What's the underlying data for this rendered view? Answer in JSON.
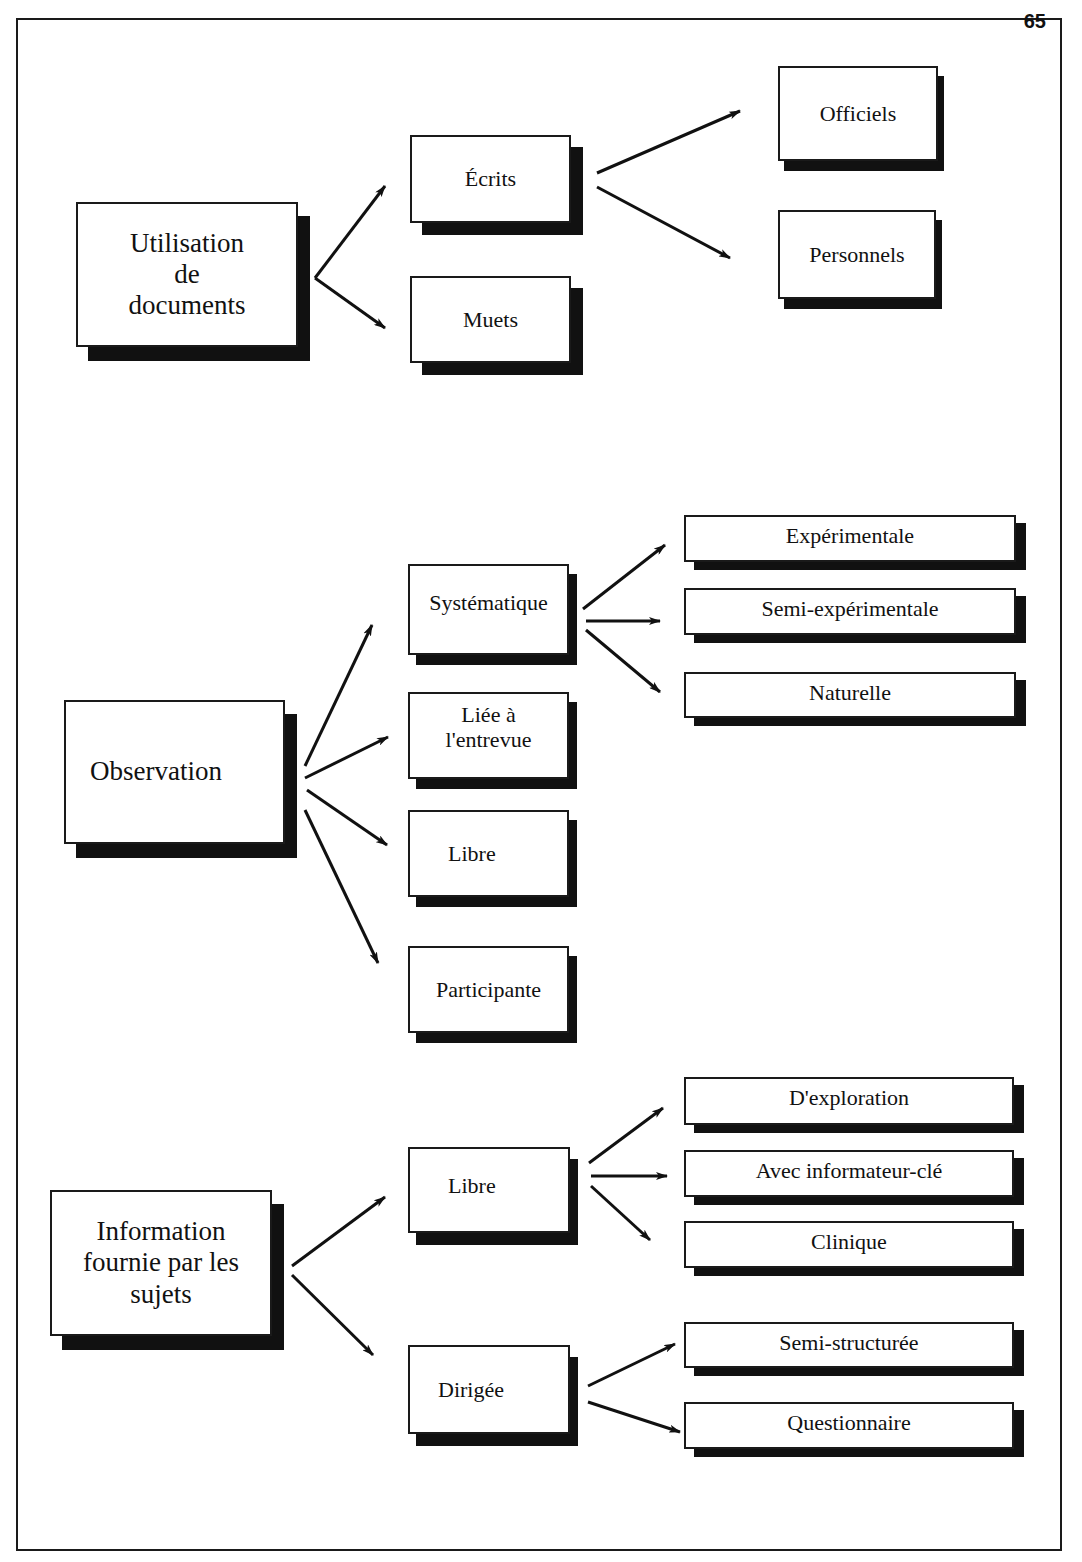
{
  "page": {
    "number": "65"
  },
  "diagram": {
    "groups": [
      {
        "root": "Utilisation\nde\ndocuments",
        "children": [
          {
            "label": "Écrits",
            "children": [
              "Officiels",
              "Personnels"
            ]
          },
          {
            "label": "Muets",
            "children": []
          }
        ]
      },
      {
        "root": "Observation",
        "children": [
          {
            "label": "Systématique",
            "children": [
              "Expérimentale",
              "Semi-expérimentale",
              "Naturelle"
            ]
          },
          {
            "label": "Liée à\nl'entrevue",
            "children": []
          },
          {
            "label": "Libre",
            "children": []
          },
          {
            "label": "Participante",
            "children": []
          }
        ]
      },
      {
        "root": "Information\nfournie par les\nsujets",
        "children": [
          {
            "label": "Libre",
            "children": [
              "D'exploration",
              "Avec informateur-clé",
              "Clinique"
            ]
          },
          {
            "label": "Dirigée",
            "children": [
              "Semi-structurée",
              "Questionnaire"
            ]
          }
        ]
      }
    ]
  },
  "labels": {
    "documents": "Utilisation de documents",
    "ecrits": "Écrits",
    "muets": "Muets",
    "officiels": "Officiels",
    "personnels": "Personnels",
    "observation": "Observation",
    "systematique": "Systématique",
    "liee_line1": "Liée à",
    "liee_line2": "l'entrevue",
    "libre_obs": "Libre",
    "participante": "Participante",
    "experimentale": "Expérimentale",
    "semi_experimentale": "Semi-expérimentale",
    "naturelle": "Naturelle",
    "info_line1": "Information",
    "info_line2": "fournie par les",
    "info_line3": "sujets",
    "libre_info": "Libre",
    "dirigee": "Dirigée",
    "exploration": "D'exploration",
    "informateur": "Avec informateur-clé",
    "clinique": "Clinique",
    "semi_structuree": "Semi-structurée",
    "questionnaire": "Questionnaire",
    "doc_line1": "Utilisation",
    "doc_line2": "de",
    "doc_line3": "documents"
  }
}
